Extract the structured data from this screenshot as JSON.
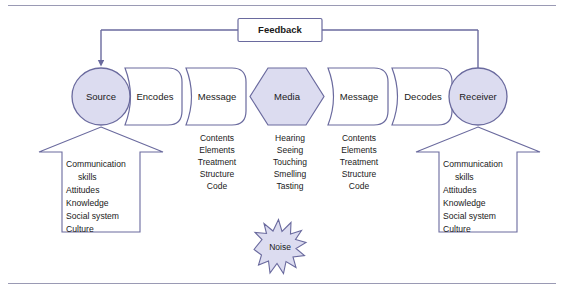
{
  "diagram": {
    "colors": {
      "shape_fill": "#dcdcf0",
      "shape_stroke": "#6a6a9e",
      "white_fill": "#ffffff",
      "line": "#6a6a9e",
      "rule": "#9a9ab4",
      "text": "#1a1a1a"
    },
    "feedback": {
      "label": "Feedback"
    },
    "flow": [
      {
        "id": "source",
        "label": "Source",
        "shape": "circle",
        "filled": true
      },
      {
        "id": "encodes",
        "label": "Encodes",
        "shape": "pennant",
        "filled": false
      },
      {
        "id": "message1",
        "label": "Message",
        "shape": "pennant",
        "filled": false
      },
      {
        "id": "media",
        "label": "Media",
        "shape": "hexagon",
        "filled": true
      },
      {
        "id": "message2",
        "label": "Message",
        "shape": "pennant",
        "filled": false
      },
      {
        "id": "decodes",
        "label": "Decodes",
        "shape": "pennant",
        "filled": false
      },
      {
        "id": "receiver",
        "label": "Receiver",
        "shape": "circle",
        "filled": true
      }
    ],
    "attribute_lists": [
      {
        "id": "message1-attributes",
        "items": [
          "Contents",
          "Elements",
          "Treatment",
          "Structure",
          "Code"
        ]
      },
      {
        "id": "media-senses",
        "items": [
          "Hearing",
          "Seeing",
          "Touching",
          "Smelling",
          "Tasting"
        ]
      },
      {
        "id": "message2-attributes",
        "items": [
          "Contents",
          "Elements",
          "Treatment",
          "Structure",
          "Code"
        ]
      }
    ],
    "arrow_boxes": [
      {
        "id": "source-factors",
        "shape": "up-arrow",
        "items": [
          "Communication",
          "skills",
          "Attitudes",
          "Knowledge",
          "Social system",
          "Culture"
        ],
        "indented": [
          false,
          true,
          false,
          false,
          false,
          false
        ]
      },
      {
        "id": "receiver-factors",
        "shape": "up-arrow",
        "items": [
          "Communication",
          "skills",
          "Attitudes",
          "Knowledge",
          "Social system",
          "Culture"
        ],
        "indented": [
          false,
          true,
          false,
          false,
          false,
          false
        ]
      }
    ],
    "noise": {
      "label": "Noise",
      "shape": "starburst"
    }
  }
}
